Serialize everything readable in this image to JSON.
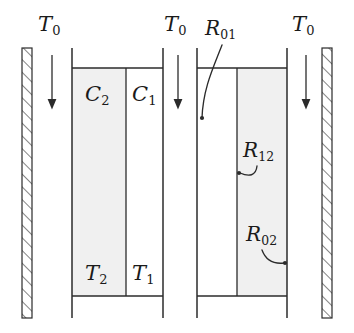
{
  "figure": {
    "type": "thermal-network-schematic",
    "title": "",
    "background_color": "#ffffff",
    "stroke_color": "#2b2b2b",
    "fill_shaded": "#f0f0f0",
    "fill_empty": "#ffffff"
  },
  "ambient_labels": [
    {
      "name": "T0-left",
      "base": "T",
      "sub": "0",
      "x": 38,
      "y": 14
    },
    {
      "name": "T0-middle",
      "base": "T",
      "sub": "0",
      "x": 164,
      "y": 14
    },
    {
      "name": "T0-right",
      "base": "T",
      "sub": "0",
      "x": 292,
      "y": 14
    }
  ],
  "arrows": [
    {
      "name": "heat-flow-arrow-left",
      "x": 52,
      "y_start": 55,
      "y_end": 108
    },
    {
      "name": "heat-flow-arrow-middle",
      "x": 178,
      "y_start": 55,
      "y_end": 108
    },
    {
      "name": "heat-flow-arrow-right",
      "x": 306,
      "y_start": 55,
      "y_end": 108
    }
  ],
  "hatched_bars": [
    {
      "name": "hatched-wall-left",
      "x": 22,
      "y": 48,
      "width": 10,
      "height": 270
    },
    {
      "name": "hatched-wall-right",
      "x": 322,
      "y": 48,
      "width": 10,
      "height": 270
    }
  ],
  "containers": [
    {
      "name": "capacitance-container",
      "x_left": 72,
      "x_divider": 126,
      "x_right": 163,
      "y_wall_top": 48,
      "y_wall_bottom": 318,
      "y_line_top": 68,
      "y_line_bottom": 296,
      "shaded_cell": "left",
      "cells": [
        {
          "name": "cell-C2",
          "side": "left",
          "top_label": {
            "base": "C",
            "sub": "2"
          },
          "bottom_label": {
            "base": "T",
            "sub": "2"
          }
        },
        {
          "name": "cell-C1",
          "side": "right",
          "top_label": {
            "base": "C",
            "sub": "1"
          },
          "bottom_label": {
            "base": "T",
            "sub": "1"
          }
        }
      ]
    },
    {
      "name": "resistance-container",
      "x_left": 197,
      "x_divider": 237,
      "x_right": 287,
      "y_wall_top": 48,
      "y_wall_bottom": 318,
      "y_line_top": 68,
      "y_line_bottom": 296,
      "shaded_cell": "right",
      "cells": [
        {
          "name": "cell-R-left",
          "side": "left",
          "top_label": null,
          "bottom_label": null
        },
        {
          "name": "cell-R-right",
          "side": "right",
          "top_label": null,
          "bottom_label": null
        }
      ]
    }
  ],
  "capacitance_labels": [
    {
      "name": "label-C2",
      "base": "C",
      "sub": "2",
      "x": 85,
      "y": 84
    },
    {
      "name": "label-C1",
      "base": "C",
      "sub": "1",
      "x": 132,
      "y": 84
    }
  ],
  "temperature_labels": [
    {
      "name": "label-T2",
      "base": "T",
      "sub": "2",
      "x": 85,
      "y": 263
    },
    {
      "name": "label-T1",
      "base": "T",
      "sub": "1",
      "x": 132,
      "y": 263
    }
  ],
  "resistance_labels": [
    {
      "name": "label-R01",
      "base": "R",
      "sub": "01",
      "x": 205,
      "y": 18,
      "leader": {
        "name": "leader-R01",
        "path": "M 222 45 C 214 66 203 88 202 118",
        "dot": {
          "x": 202,
          "y": 118
        }
      }
    },
    {
      "name": "label-R12",
      "base": "R",
      "sub": "12",
      "x": 243,
      "y": 140,
      "leader": {
        "name": "leader-R12",
        "path": "M 257 166 C 256 175 248 176 240 173",
        "dot": {
          "x": 239,
          "y": 173
        }
      }
    },
    {
      "name": "label-R02",
      "base": "R",
      "sub": "02",
      "x": 246,
      "y": 224,
      "leader": {
        "name": "leader-R02",
        "path": "M 262 250 C 266 261 275 264 284 263",
        "dot": {
          "x": 285,
          "y": 263
        }
      }
    }
  ]
}
